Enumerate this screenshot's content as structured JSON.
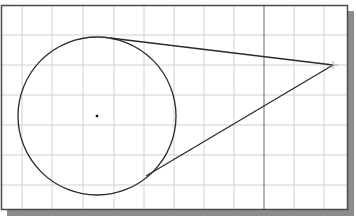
{
  "drawing": {
    "frame": {
      "x": 1,
      "y": 5,
      "width": 347,
      "height": 205
    },
    "shadow_color": "#8c8c8c",
    "frame_color": "#4a4a4a",
    "grid_color": "#d0d0d0",
    "axis_color": "#6a6a6a",
    "stroke_color": "#2a2a2a",
    "grid": {
      "vertical": [
        22,
        52,
        83,
        114,
        144,
        174,
        204,
        234,
        294,
        324
      ],
      "horizontal": [
        35,
        65,
        95,
        125,
        155,
        185
      ],
      "axis_x": 264
    },
    "circle": {
      "cx": 97,
      "cy": 116,
      "r": 79,
      "center_marker": true
    },
    "apex_point": {
      "x": 333,
      "y": 65
    },
    "tangent_lines": [
      {
        "x1": 110,
        "y1": 38,
        "x2": 333,
        "y2": 65
      },
      {
        "x1": 146,
        "y1": 176,
        "x2": 333,
        "y2": 65
      }
    ]
  }
}
